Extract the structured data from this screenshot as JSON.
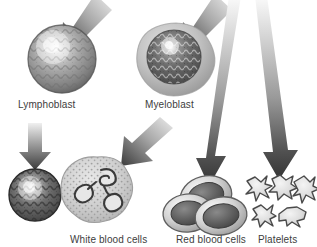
{
  "figure": {
    "background_color": "#ffffff",
    "width": 317,
    "height": 247,
    "palette": {
      "label_text": "#3d3d3d",
      "arrow_dark": "#3a3a3a",
      "arrow_light": "#e9e9e9",
      "cell_mid_gray": "#8f8f8f",
      "cell_dark_gray": "#4a4a4a",
      "cell_light_gray": "#c9c9c9",
      "outline": "#2e2e2e"
    }
  },
  "labels": {
    "lymphoblast": "Lymphoblast",
    "myeloblast": "Myeloblast",
    "white_blood_cells": "White blood cells",
    "red_blood_cells": "Red blood cells",
    "platelets": "Platelets"
  },
  "cells": [
    {
      "id": "lymphoblast",
      "label": "Lymphoblast",
      "row": "top",
      "center": [
        62,
        59
      ],
      "radius": 35,
      "appearance": "round textured gray sphere with bright highlight center"
    },
    {
      "id": "myeloblast",
      "label": "Myeloblast",
      "row": "top",
      "center": [
        176,
        60
      ],
      "radius": 37,
      "appearance": "dark granular nucleus surrounded by pale gray cytoplasm rim"
    },
    {
      "id": "lymphocyte",
      "label": "White blood cells",
      "row": "bottom",
      "center": [
        35,
        195
      ],
      "radius": 27,
      "appearance": "dark textured cell with light nucleus highlight"
    },
    {
      "id": "granulocyte",
      "label": "White blood cells",
      "row": "bottom",
      "center": [
        97,
        193
      ],
      "radius": 36,
      "appearance": "pale speckled cytoplasm with dark multi-lobed nucleus"
    },
    {
      "id": "erythrocytes",
      "label": "Red blood cells",
      "row": "bottom",
      "center": [
        208,
        208
      ],
      "count": 3,
      "appearance": "three overlapping biconcave discs, light rim, dark depression"
    },
    {
      "id": "platelets",
      "label": "Platelets",
      "row": "bottom",
      "center": [
        280,
        205
      ],
      "count": 5,
      "appearance": "five small pale spiky star-shaped fragments with dark outlines"
    }
  ],
  "arrows": [
    {
      "id": "arrow-to-lymphoblast",
      "from": [
        90,
        2
      ],
      "to": [
        62,
        33
      ],
      "style": "short diagonal down-left"
    },
    {
      "id": "arrow-to-myeloblast",
      "from": [
        210,
        2
      ],
      "to": [
        182,
        32
      ],
      "style": "short diagonal down-left"
    },
    {
      "id": "arrow-lymphoblast-to-lymphocyte",
      "from": [
        34,
        123
      ],
      "to": [
        34,
        167
      ],
      "style": "short vertical down"
    },
    {
      "id": "arrow-myeloblast-to-granulocyte",
      "from": [
        155,
        120
      ],
      "to": [
        120,
        162
      ],
      "style": "short diagonal down-left"
    },
    {
      "id": "arrow-myeloblast-to-rbc",
      "from": [
        229,
        6
      ],
      "to": [
        211,
        184
      ],
      "style": "long tapering down"
    },
    {
      "id": "arrow-myeloblast-to-platelets",
      "from": [
        258,
        6
      ],
      "to": [
        279,
        178
      ],
      "style": "long tapering down"
    }
  ]
}
